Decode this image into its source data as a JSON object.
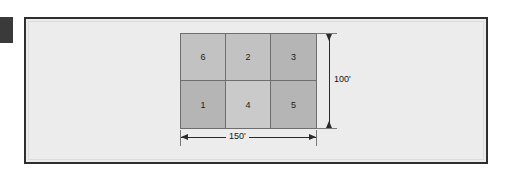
{
  "diagram": {
    "frame": {
      "border_color": "#2e2e2e",
      "background_color": "#ececec"
    },
    "edge_marker": {
      "name": "page-edge-marker",
      "color": "#3a3a3a"
    },
    "grid": {
      "rows": 2,
      "columns": 3,
      "line_color": "#6e6e6e",
      "cells": [
        {
          "label": "6",
          "row": 1,
          "column": 1,
          "shade": "#c2c2c2"
        },
        {
          "label": "2",
          "row": 1,
          "column": 2,
          "shade": "#c2c2c2"
        },
        {
          "label": "3",
          "row": 1,
          "column": 3,
          "shade": "#b5b5b5"
        },
        {
          "label": "1",
          "row": 2,
          "column": 1,
          "shade": "#b5b5b5"
        },
        {
          "label": "4",
          "row": 2,
          "column": 2,
          "shade": "#cacaca"
        },
        {
          "label": "5",
          "row": 2,
          "column": 3,
          "shade": "#b5b5b5"
        }
      ]
    },
    "dimensions": {
      "vertical": {
        "label": "100'",
        "value": 100,
        "unit": "feet",
        "orientation": "vertical",
        "position": "right"
      },
      "horizontal": {
        "label": "150'",
        "value": 150,
        "unit": "feet",
        "orientation": "horizontal",
        "position": "bottom"
      }
    }
  }
}
